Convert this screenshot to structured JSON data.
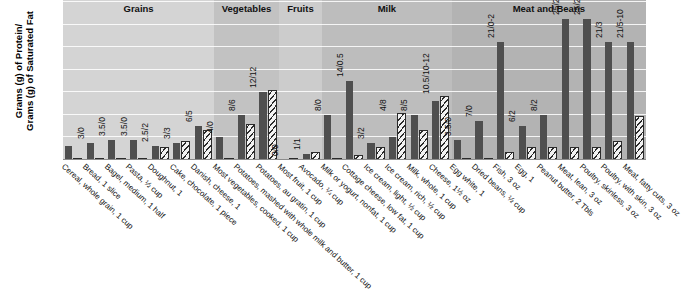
{
  "chart_data": {
    "type": "bar",
    "title": "",
    "xlabel": "",
    "ylabel": "Grams (g) of Protein/ Grams (g) of Saturated Fat",
    "ylabel_line1": "Grams (g) of Protein/",
    "ylabel_line2": "Grams (g) of Saturated Fat",
    "ylim": [
      0,
      28
    ],
    "grid": true,
    "gridlines": [
      4,
      8,
      12,
      16,
      20,
      24,
      28
    ],
    "legend_position": "none",
    "series": [
      {
        "name": "Protein",
        "color": "#4f4f4f",
        "fill": "solid"
      },
      {
        "name": "Saturated Fat",
        "color": "#f2f2f2",
        "fill": "diagonal-hatch"
      }
    ],
    "groups": [
      {
        "name": "Grains",
        "categories": [
          "Cereal, whole grain, 1 cup",
          "Bread, 1 slice",
          "Bagel, medium, 1 half",
          "Pasta, ½ cup",
          "Doughnut, 1",
          "Cake, chocolate, 1 piece",
          "Danish, cheese, 1"
        ],
        "labels": [
          "2.5/0",
          "3/0",
          "3.5/0",
          "3.5/0",
          "2.5/2",
          "3/3",
          "6/5"
        ],
        "protein": [
          2.5,
          3,
          3.5,
          3.5,
          2.5,
          3,
          6
        ],
        "fat": [
          0,
          0,
          0,
          0,
          2,
          3,
          5
        ]
      },
      {
        "name": "Vegetables",
        "categories": [
          "Most vegetables, cooked, 1 cup",
          "Potatoes, mashed with whole milk and butter, 1 cup",
          "Potatoes, au gratin, 1 cup"
        ],
        "labels": [
          "4/0",
          "8/6",
          "12/12"
        ],
        "protein": [
          4,
          8,
          12
        ],
        "fat": [
          0,
          6,
          12
        ]
      },
      {
        "name": "Fruits",
        "categories": [
          "Most fruit, 1 cup",
          "Avocado, ¼ cup"
        ],
        "labels": [
          "0/0",
          "1/1"
        ],
        "protein": [
          0,
          1
        ],
        "fat": [
          0,
          1
        ]
      },
      {
        "name": "Milk",
        "categories": [
          "Milk or yogurt, nonfat, 1 cup",
          "Cottage cheese, low fat, 1 cup",
          "Ice cream, light, ½ cup",
          "Ice cream, rich, ½ cup",
          "Milk, whole, 1 cup",
          "Cheese, 1½ oz"
        ],
        "labels": [
          "8/0",
          "14/0.5",
          "3/2",
          "4/8",
          "8/5",
          "10.5/10-12"
        ],
        "protein": [
          8,
          14,
          3,
          4,
          8,
          10.5
        ],
        "fat": [
          0,
          0.5,
          2,
          8,
          5,
          11
        ]
      },
      {
        "name": "Meat and Beans",
        "categories": [
          "Egg white, 1",
          "Dried beans, ½ cup",
          "Fish, 3 oz",
          "Egg, 1",
          "Peanut butter, 2 Tbls",
          "Meat, lean, 3 oz",
          "Poultry, skinless, 3 oz",
          "Poultry, with skin, 3 oz",
          "Meat, fatty cuts, 3 oz"
        ],
        "labels": [
          "3.5/0",
          "7/0",
          "21/0-2",
          "6/2",
          "8/2",
          "25/2",
          "25/2",
          "21/3",
          "21/5-10"
        ],
        "protein": [
          3.5,
          7,
          21,
          6,
          8,
          25,
          25,
          21,
          21
        ],
        "fat": [
          0,
          0,
          1,
          2,
          2,
          2,
          2,
          3,
          7.5
        ]
      }
    ]
  }
}
